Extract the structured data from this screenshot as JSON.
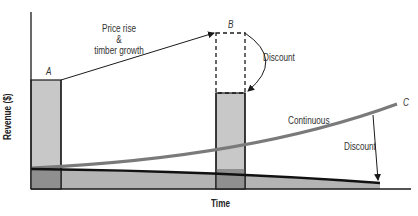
{
  "diagram": {
    "title": "",
    "axes": {
      "x_label": "Time",
      "y_label": "Revenue ($)"
    },
    "points": {
      "A": "A",
      "B": "B",
      "C": "C"
    },
    "annotations": {
      "price_rise_line1": "Price rise",
      "price_rise_line2": "&",
      "price_rise_line3": "timber growth",
      "discount_b": "Discount",
      "continuous": "Continuous",
      "discount_c": "Discount"
    },
    "colors": {
      "bar_fill": "#c8c8c8",
      "bar_overlap": "#8f8f8f",
      "band_fill": "#b4b4b4",
      "continuous_curve": "#7a7a7a",
      "axis": "#1a1a1a"
    }
  }
}
